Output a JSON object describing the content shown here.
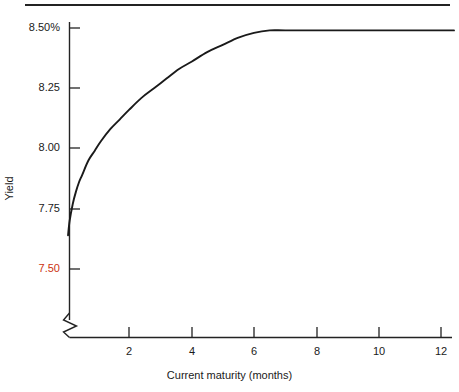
{
  "chart_data": {
    "type": "line",
    "title": "",
    "xlabel": "Current maturity (months)",
    "ylabel": "Yield",
    "xlim": [
      0,
      12.5
    ],
    "ylim": [
      7.5,
      8.5
    ],
    "grid": false,
    "legend": "none",
    "axis_break": true,
    "x_ticks": [
      "2",
      "4",
      "6",
      "8",
      "10",
      "12"
    ],
    "x_tick_values": [
      2,
      4,
      6,
      8,
      10,
      12
    ],
    "y_ticks": [
      "8.50%",
      "8.25",
      "8.00",
      "7.75",
      "7.50"
    ],
    "y_tick_values": [
      8.5,
      8.25,
      8.0,
      7.75,
      7.5
    ],
    "y_tick_colors": [
      "#1a1a1a",
      "#1a1a1a",
      "#1a1a1a",
      "#1a1a1a",
      "#cc3311"
    ],
    "series": [
      {
        "name": "Yield curve",
        "color": "#1a1a1a",
        "x": [
          0.05,
          0.1,
          0.2,
          0.3,
          0.4,
          0.5,
          0.7,
          0.9,
          1.1,
          1.4,
          1.7,
          2.0,
          2.4,
          2.8,
          3.2,
          3.6,
          4.0,
          4.5,
          5.0,
          5.5,
          6.0,
          6.5,
          7.0,
          8.0,
          9.0,
          10.0,
          11.0,
          12.0,
          12.4
        ],
        "y": [
          7.64,
          7.7,
          7.77,
          7.82,
          7.86,
          7.89,
          7.95,
          7.99,
          8.03,
          8.08,
          8.12,
          8.16,
          8.21,
          8.25,
          8.29,
          8.33,
          8.36,
          8.4,
          8.43,
          8.46,
          8.48,
          8.49,
          8.49,
          8.49,
          8.49,
          8.49,
          8.49,
          8.49,
          8.49
        ]
      }
    ]
  },
  "colors": {
    "axis": "#232323",
    "curve": "#1a1a1a",
    "highlight": "#cc3311",
    "background": "#ffffff"
  }
}
